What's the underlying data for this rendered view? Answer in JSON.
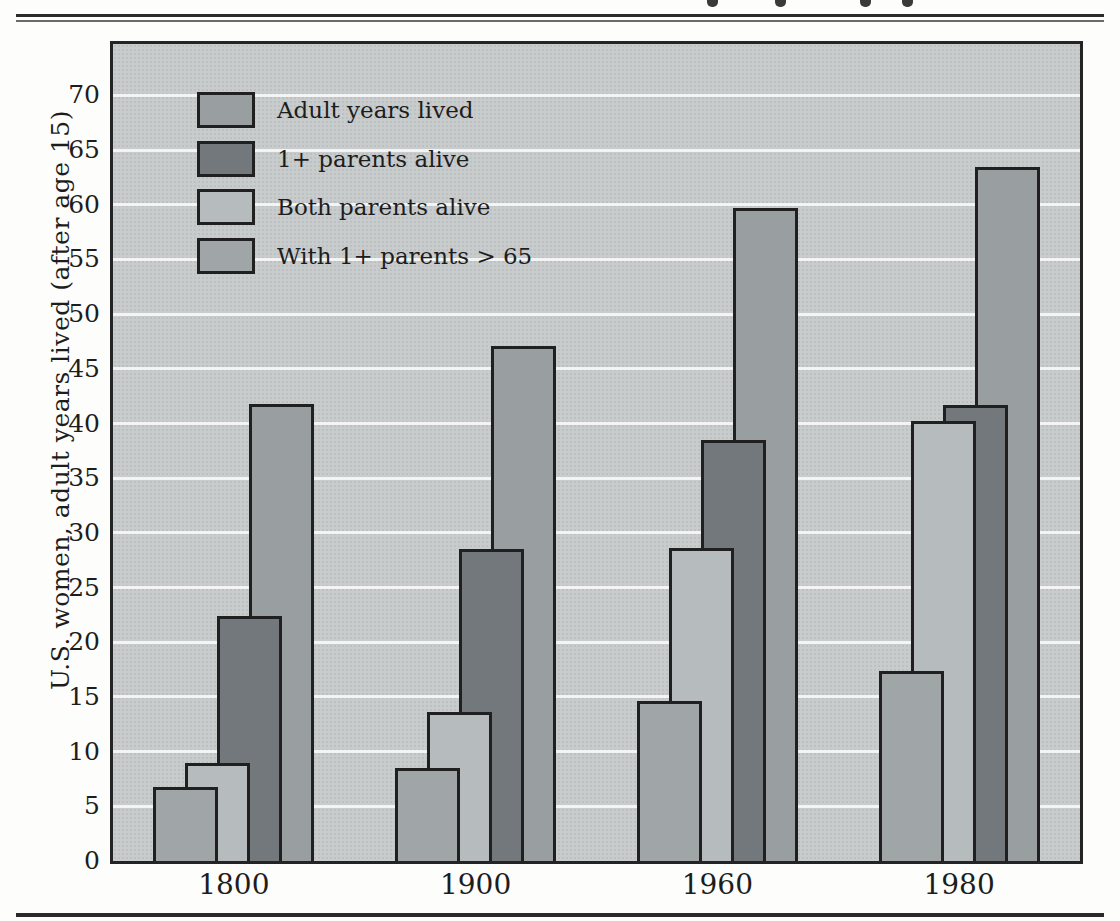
{
  "chart_data": {
    "type": "bar",
    "title": "",
    "xlabel": "",
    "ylabel": "U.S. women, adult years lived (after age 15)",
    "categories": [
      "1800",
      "1900",
      "1960",
      "1980"
    ],
    "series": [
      {
        "name": "Adult years lived",
        "values": [
          41.8,
          47.1,
          59.7,
          63.5
        ],
        "color": "#999fa1"
      },
      {
        "name": "1+ parents alive",
        "values": [
          22.4,
          28.5,
          38.5,
          41.7
        ],
        "color": "#72787b"
      },
      {
        "name": "Both parents alive",
        "values": [
          9.0,
          13.6,
          28.6,
          40.2
        ],
        "color": "#b6bbbd"
      },
      {
        "name": "With 1+ parents > 65",
        "values": [
          6.8,
          8.5,
          14.6,
          17.4
        ],
        "color": "#a0a5a7"
      }
    ],
    "yticks": [
      0,
      5,
      10,
      15,
      20,
      25,
      30,
      35,
      40,
      45,
      50,
      55,
      60,
      65,
      70
    ],
    "ylim": [
      0,
      74.7
    ],
    "grid": true,
    "gridline_color": "#f3f4f3",
    "plot_background": "#c9cccd",
    "legend_position": "top-left",
    "bar_display_order": "series order reversed left-to-right within each group; leftmost bar overlaps in front",
    "bar_overlap_fraction": 0.5
  }
}
